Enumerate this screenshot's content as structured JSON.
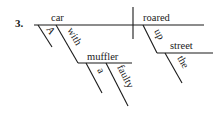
{
  "diagram": {
    "number": "3.",
    "subject": "car",
    "verb": "roared",
    "modifiers": {
      "article_subject": "A",
      "preposition": "with",
      "prep_object": "muffler",
      "article_object": "a",
      "adjective_object": "faulty",
      "adverb_preposition": "up",
      "adverb_object": "street",
      "article_adverb_object": "the"
    },
    "line_color": "#1a1a1a"
  }
}
